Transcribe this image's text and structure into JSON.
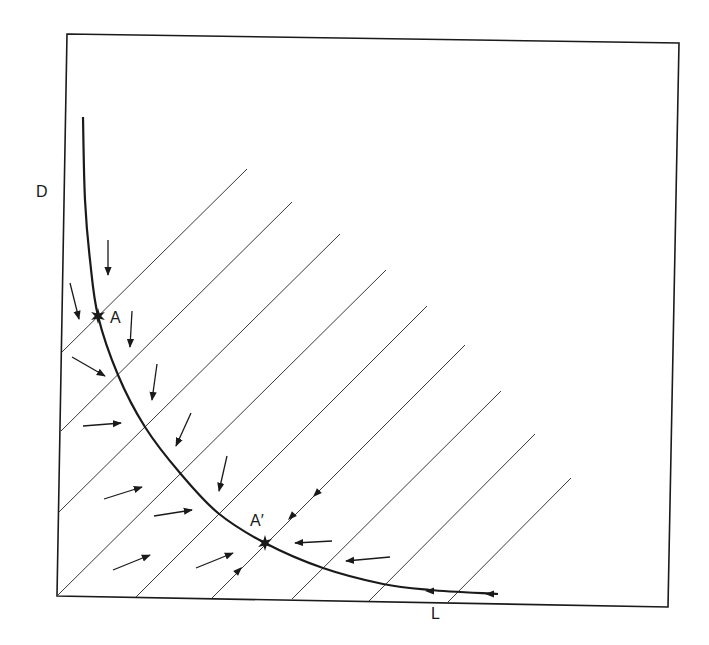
{
  "diagram": {
    "axes": {
      "y_label": "D",
      "x_label": "L"
    },
    "points": [
      {
        "id": "A",
        "label": "A",
        "x": 98,
        "y": 316
      },
      {
        "id": "A_prime",
        "label": "A′",
        "x": 265,
        "y": 543
      }
    ],
    "frame": {
      "top_left": [
        67,
        34
      ],
      "top_right": [
        679,
        43
      ],
      "bottom_right": [
        668,
        607
      ],
      "bottom_left": [
        57,
        596
      ]
    },
    "curve": {
      "description": "Downward-sloping convex curve (isocline) from upper-left to lower-right",
      "points": [
        [
          83,
          117
        ],
        [
          85,
          200
        ],
        [
          90,
          260
        ],
        [
          98,
          316
        ],
        [
          118,
          375
        ],
        [
          145,
          427
        ],
        [
          180,
          473
        ],
        [
          218,
          513
        ],
        [
          265,
          543
        ],
        [
          323,
          568
        ],
        [
          383,
          584
        ],
        [
          430,
          590
        ],
        [
          498,
          594
        ]
      ]
    },
    "hatch_lines": [
      {
        "from": [
          247,
          169
        ],
        "to": [
          62,
          352
        ]
      },
      {
        "from": [
          292,
          202
        ],
        "to": [
          61,
          431
        ]
      },
      {
        "from": [
          340,
          234
        ],
        "to": [
          59,
          512
        ]
      },
      {
        "from": [
          386,
          270
        ],
        "to": [
          57,
          596
        ]
      },
      {
        "from": [
          427,
          306
        ],
        "to": [
          136,
          597
        ]
      },
      {
        "from": [
          465,
          345
        ],
        "to": [
          212,
          598
        ]
      },
      {
        "from": [
          501,
          391
        ],
        "to": [
          292,
          599
        ]
      },
      {
        "from": [
          535,
          434
        ],
        "to": [
          369,
          601
        ]
      },
      {
        "from": [
          571,
          478
        ],
        "to": [
          448,
          602
        ]
      }
    ],
    "arrows": [
      {
        "from": [
          108,
          240
        ],
        "to": [
          108,
          275
        ]
      },
      {
        "from": [
          70,
          283
        ],
        "to": [
          79,
          319
        ]
      },
      {
        "from": [
          132,
          311
        ],
        "to": [
          130,
          347
        ]
      },
      {
        "from": [
          72,
          357
        ],
        "to": [
          105,
          376
        ]
      },
      {
        "from": [
          157,
          364
        ],
        "to": [
          152,
          400
        ]
      },
      {
        "from": [
          83,
          426
        ],
        "to": [
          121,
          423
        ]
      },
      {
        "from": [
          191,
          413
        ],
        "to": [
          176,
          446
        ]
      },
      {
        "from": [
          227,
          456
        ],
        "to": [
          219,
          491
        ]
      },
      {
        "from": [
          104,
          499
        ],
        "to": [
          142,
          487
        ]
      },
      {
        "from": [
          154,
          516
        ],
        "to": [
          192,
          510
        ]
      },
      {
        "from": [
          113,
          570
        ],
        "to": [
          150,
          555
        ]
      },
      {
        "from": [
          196,
          568
        ],
        "to": [
          233,
          553
        ]
      },
      {
        "from": [
          332,
          541
        ],
        "to": [
          295,
          543
        ]
      },
      {
        "from": [
          390,
          557
        ],
        "to": [
          346,
          561
        ]
      }
    ],
    "line_arrowheads": [
      {
        "at": [
          242,
          567
        ],
        "dir": [
          1,
          -1
        ]
      },
      {
        "at": [
          313,
          497
        ],
        "dir": [
          -1,
          1
        ]
      },
      {
        "at": [
          288,
          520
        ],
        "dir": [
          -1,
          1
        ]
      },
      {
        "at": [
          425,
          591
        ],
        "dir": [
          -1,
          0
        ]
      },
      {
        "at": [
          485,
          594
        ],
        "dir": [
          -1,
          0
        ]
      }
    ],
    "colors": {
      "ink": "#1a1a1a",
      "hatch": "#3a3a3a",
      "background": "#ffffff"
    }
  }
}
